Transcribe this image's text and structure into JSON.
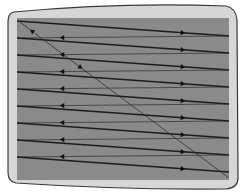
{
  "diagram": {
    "colors": {
      "background": "#ffffff",
      "bezel": "#d6d6d6",
      "bezel_outline": "#3a3a3a",
      "screen": "#8a8a8a",
      "trace_line": "#1c1c1c",
      "retrace_line": "#2e2e2e"
    },
    "screen_rect": {
      "x": 17,
      "y": 18,
      "width": 212,
      "height": 162
    },
    "scan_lines": [
      {
        "x1": 17,
        "y1": 21,
        "x2": 229,
        "y2": 36
      },
      {
        "x1": 17,
        "y1": 38,
        "x2": 229,
        "y2": 53
      },
      {
        "x1": 17,
        "y1": 55,
        "x2": 229,
        "y2": 70
      },
      {
        "x1": 17,
        "y1": 72,
        "x2": 229,
        "y2": 87
      },
      {
        "x1": 17,
        "y1": 89,
        "x2": 229,
        "y2": 104
      },
      {
        "x1": 17,
        "y1": 106,
        "x2": 229,
        "y2": 121
      },
      {
        "x1": 17,
        "y1": 123,
        "x2": 229,
        "y2": 138
      },
      {
        "x1": 17,
        "y1": 140,
        "x2": 229,
        "y2": 155
      },
      {
        "x1": 17,
        "y1": 157,
        "x2": 229,
        "y2": 172
      }
    ],
    "trace_arrow_x": 183,
    "retrace_arrow_x": 62,
    "vertical_retrace": {
      "x1": 229,
      "y1": 178,
      "x2": 17,
      "y2": 20
    },
    "labels": {
      "trace": "horizontal trace (left to right)",
      "retrace": "horizontal retrace (right to left)",
      "vertical_retrace": "vertical retrace"
    }
  }
}
